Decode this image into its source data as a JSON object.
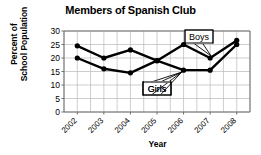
{
  "chart_data": {
    "type": "line",
    "title": "Members of Spanish Club",
    "xlabel": "Year",
    "ylabel": "Percent of School Population",
    "ylabel_line1": "Percent of",
    "ylabel_line2": "School Population",
    "categories": [
      "2002",
      "2003",
      "2004",
      "2005",
      "2006",
      "2007",
      "2008"
    ],
    "x": [
      2002,
      2003,
      2004,
      2005,
      2006,
      2007,
      2008
    ],
    "series": [
      {
        "name": "Boys",
        "values": [
          24.5,
          20,
          23,
          19,
          25,
          20,
          26.5
        ]
      },
      {
        "name": "Girls",
        "values": [
          20,
          16,
          14.5,
          19,
          15.5,
          15.5,
          25
        ]
      }
    ],
    "ylim": [
      0,
      30
    ],
    "yticks": [
      0,
      5,
      10,
      15,
      20,
      25,
      30
    ],
    "ytick_labels": [
      "0",
      "5",
      "10",
      "15",
      "20",
      "25",
      "30"
    ],
    "grid": true,
    "legend": "annotations",
    "annotations": [
      {
        "label": "Boys",
        "series": "Boys"
      },
      {
        "label": "Girls",
        "series": "Girls"
      }
    ]
  }
}
